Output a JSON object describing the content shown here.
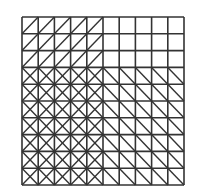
{
  "diagram": {
    "type": "grid-triangulation",
    "rows": 10,
    "cols": 10,
    "origin": [
      22,
      17
    ],
    "cell_size": [
      16.2,
      16.8
    ],
    "line_color": "#333333",
    "background": "#ffffff",
    "regions": [
      {
        "name": "top-left",
        "rows": [
          0,
          2
        ],
        "cols": [
          0,
          4
        ],
        "pattern": "slash"
      },
      {
        "name": "top-right",
        "rows": [
          0,
          2
        ],
        "cols": [
          5,
          9
        ],
        "pattern": "none"
      },
      {
        "name": "bottom-left",
        "rows": [
          3,
          9
        ],
        "cols": [
          0,
          4
        ],
        "pattern": "cross"
      },
      {
        "name": "bottom-right",
        "rows": [
          3,
          9
        ],
        "cols": [
          5,
          9
        ],
        "pattern": "backslash"
      }
    ]
  }
}
